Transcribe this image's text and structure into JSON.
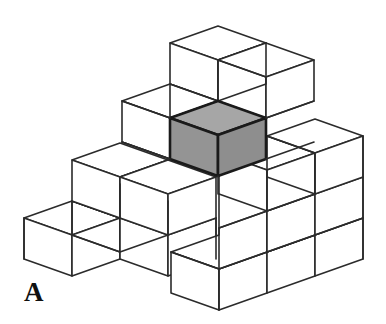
{
  "figure": {
    "label": "A",
    "label_position": {
      "x": 24,
      "y": 279
    },
    "caption_domain": "isometric-cube-stack",
    "background_color": "#ffffff",
    "line_color": "#2b2b2b",
    "face_color": "#ffffff",
    "highlight_fill": "#9a9a9a",
    "highlight_top_fill": "#a6a6a6",
    "highlight_left_fill": "#949494",
    "highlight_right_fill": "#8e8e8e",
    "highlight_outline_color": "#1a1a1a",
    "stroke_width": 1.6,
    "highlight_stroke_width": 2.6
  },
  "geometry": {
    "half_width": 48,
    "half_depth": 17,
    "cube_height": 41,
    "origin_x": 219,
    "origin_y": 297,
    "description": "Isometric projection: screen_x = origin_x + (c - r) * half_width; screen_y = origin_y - (c + r) * half_depth - level * cube_height"
  },
  "structure": {
    "type": "staircase-stack",
    "note": "Heights of each column of the footprint grid, rows go back-right, cols go back-left.",
    "columns": [
      {
        "row": 0,
        "col": 0,
        "height": 3
      },
      {
        "row": 0,
        "col": 1,
        "height": 3
      },
      {
        "row": 0,
        "col": 2,
        "height": 2
      },
      {
        "row": 0,
        "col": 3,
        "height": 1
      },
      {
        "row": 1,
        "col": 0,
        "height": 4
      },
      {
        "row": 1,
        "col": 1,
        "height": 4
      },
      {
        "row": 1,
        "col": 2,
        "height": 2
      },
      {
        "row": 1,
        "col": 3,
        "height": 1
      },
      {
        "row": 2,
        "col": 0,
        "height": 3
      },
      {
        "row": 2,
        "col": 1,
        "height": 3
      },
      {
        "row": 2,
        "col": 2,
        "height": 2
      },
      {
        "row": 2,
        "col": 3,
        "height": 1
      }
    ],
    "highlighted_cube": {
      "row": 1,
      "col": 1,
      "level": 2
    },
    "total_visible_cube_count": 12
  }
}
